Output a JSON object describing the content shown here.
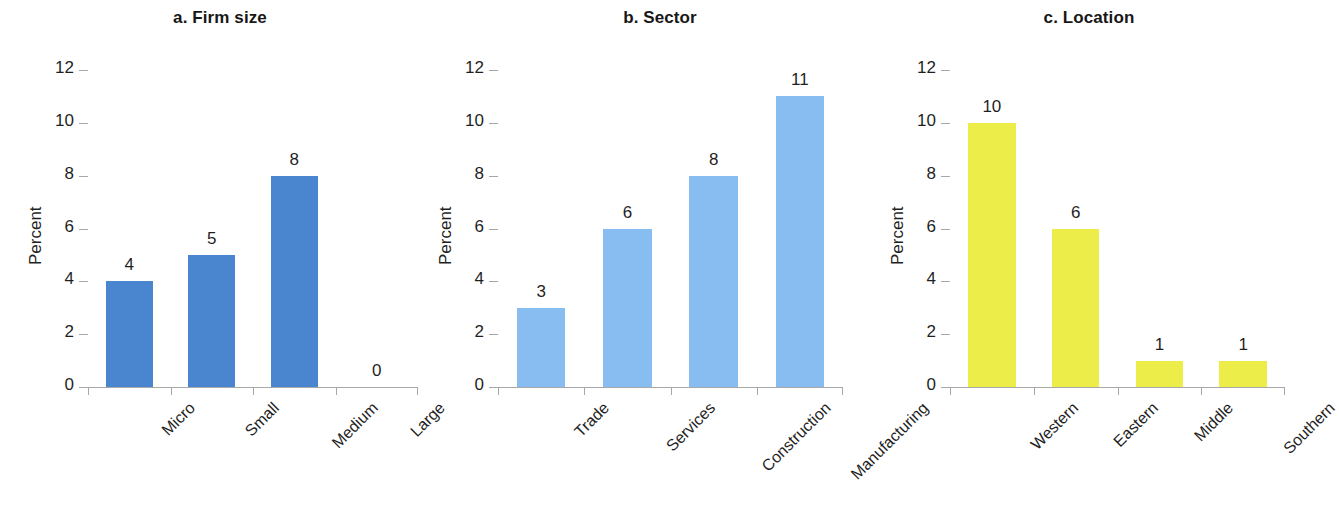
{
  "figure": {
    "background": "#ffffff",
    "axis_color": "#a8a8a8",
    "text_color": "#1f1f1f"
  },
  "chart_data": [
    {
      "type": "bar",
      "panel_id": "a",
      "title": "a. Firm size",
      "xlabel": "",
      "ylabel": "Percent",
      "ylim": [
        0,
        12
      ],
      "yticks": [
        0,
        2,
        4,
        6,
        8,
        10,
        12
      ],
      "ytick_labels": [
        "0",
        "2",
        "4",
        "6",
        "8",
        "10",
        "12"
      ],
      "grid": false,
      "legend": "none",
      "bar_color": "#4a86d0",
      "categories": [
        "Micro",
        "Small",
        "Medium",
        "Large"
      ],
      "values": [
        4,
        5,
        8,
        0
      ],
      "value_labels": [
        "4",
        "5",
        "8",
        "0"
      ]
    },
    {
      "type": "bar",
      "panel_id": "b",
      "title": "b. Sector",
      "xlabel": "",
      "ylabel": "Percent",
      "ylim": [
        0,
        12
      ],
      "yticks": [
        0,
        2,
        4,
        6,
        8,
        10,
        12
      ],
      "ytick_labels": [
        "0",
        "2",
        "4",
        "6",
        "8",
        "10",
        "12"
      ],
      "grid": false,
      "legend": "none",
      "bar_color": "#87bdf0",
      "categories": [
        "Trade",
        "Services",
        "Construction",
        "Manufacturing"
      ],
      "values": [
        3,
        6,
        8,
        11
      ],
      "value_labels": [
        "3",
        "6",
        "8",
        "11"
      ]
    },
    {
      "type": "bar",
      "panel_id": "c",
      "title": "c. Location",
      "xlabel": "",
      "ylabel": "Percent",
      "ylim": [
        0,
        12
      ],
      "yticks": [
        0,
        2,
        4,
        6,
        8,
        10,
        12
      ],
      "ytick_labels": [
        "0",
        "2",
        "4",
        "6",
        "8",
        "10",
        "12"
      ],
      "grid": false,
      "legend": "none",
      "bar_color": "#eded49",
      "categories": [
        "Western",
        "Eastern",
        "Middle",
        "Southern"
      ],
      "values": [
        10,
        6,
        1,
        1
      ],
      "value_labels": [
        "10",
        "6",
        "1",
        "1"
      ]
    }
  ]
}
